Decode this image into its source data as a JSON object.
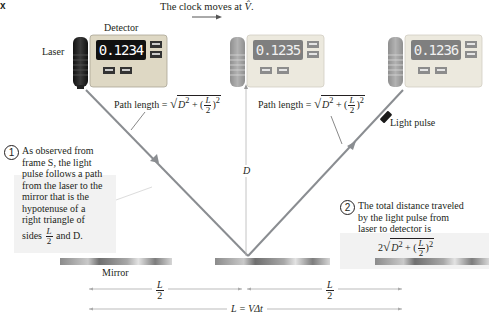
{
  "corner_label": "x",
  "caption": {
    "text": "The clock moves at",
    "symbol": "V̂",
    "period": "."
  },
  "labels": {
    "detector": "Detector",
    "laser": "Laser",
    "light_pulse": "Light pulse",
    "mirror": "Mirror",
    "D": "D"
  },
  "clocks": [
    {
      "reading": "0.1234"
    },
    {
      "reading": "0.1235"
    },
    {
      "reading": "0.1236"
    }
  ],
  "path_formula": {
    "prefix": "Path length = ",
    "D2": "D",
    "exp": "2",
    "plus": " + (",
    "L": "L",
    "two": "2",
    "close": ")",
    "exp2": "2"
  },
  "notes": [
    {
      "num": "1",
      "lines": [
        "As observed from",
        "frame S, the light",
        "pulse follows a path",
        "from the laser to the",
        "mirror that is the",
        "hypotenuse of a",
        "right triangle of"
      ],
      "last_prefix": "sides ",
      "last_suffix": " and D."
    },
    {
      "num": "2",
      "lines": [
        "The total distance traveled",
        "by the light pulse from",
        "laser to detector is"
      ],
      "formula_prefix": "2"
    }
  ],
  "dimensions": {
    "half_L_num": "L",
    "half_L_den": "2",
    "total": "L = VΔt"
  },
  "colors": {
    "beam": "#8a8d91",
    "text": "#231f20",
    "panel": "#dcd9c9",
    "lcd_bg": "#1a1a1a",
    "lcd_fg": "#ffffff",
    "note_bg": "#f2f2f2",
    "mirror": "#9a9a9a"
  }
}
